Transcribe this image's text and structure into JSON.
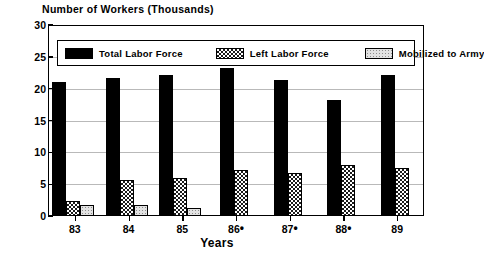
{
  "chart_data": {
    "type": "bar",
    "title": "",
    "ylabel": "Number of Workers (Thousands)",
    "xlabel": "Years",
    "categories": [
      "83",
      "84",
      "85",
      "86•",
      "87•",
      "88•",
      "89"
    ],
    "ylim": [
      0,
      30
    ],
    "ytick_labels": [
      "0",
      "5",
      "10",
      "15",
      "20",
      "25",
      "30"
    ],
    "ytick_values": [
      0,
      5,
      10,
      15,
      20,
      25,
      30
    ],
    "grid": true,
    "grid_axis": "y",
    "legend_position": "inside-top",
    "series": [
      {
        "name": "Total Labor Force",
        "fill": "solid-black",
        "color": "#000000",
        "values": [
          21.0,
          21.7,
          22.2,
          23.2,
          21.4,
          18.2,
          22.2
        ]
      },
      {
        "name": "Left Labor Force",
        "fill": "checkered",
        "color": "#1a1a1a",
        "values": [
          2.3,
          5.6,
          5.9,
          7.2,
          6.8,
          8.0,
          7.5
        ]
      },
      {
        "name": "Mobilized to Army",
        "fill": "light-dotted",
        "color": "#e2e2e2",
        "values": [
          1.7,
          1.8,
          1.3,
          0,
          0,
          0,
          0
        ]
      }
    ]
  },
  "legend": {
    "items": [
      {
        "label": "Total Labor Force",
        "swatch": "solid-black-swatch"
      },
      {
        "label": "Left Labor Force",
        "swatch": "checkered-swatch"
      },
      {
        "label": "Mobilized to Army",
        "swatch": "light-dotted-swatch"
      }
    ]
  },
  "axes": {
    "y_title": "Number of Workers (Thousands)",
    "x_title": "Years"
  }
}
